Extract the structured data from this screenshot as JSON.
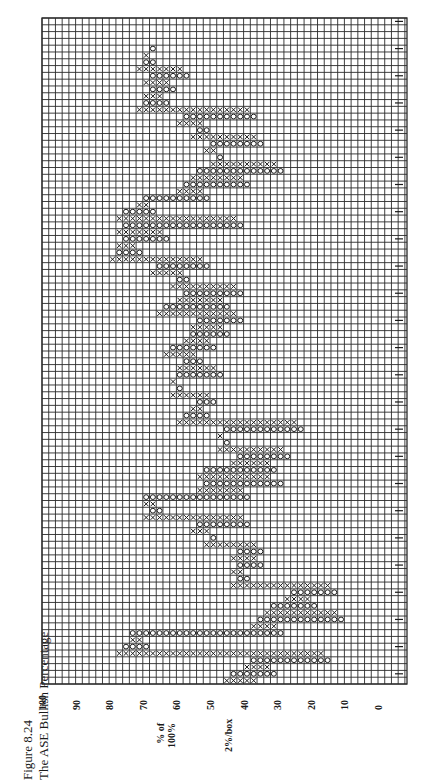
{
  "figure": {
    "number": "Figure 8.24",
    "title": "The ASE Bullish Percentage"
  },
  "chart_data": {
    "type": "point-and-figure",
    "title": "The ASE Bullish Percentage",
    "orientation": "rotated 90° counter-clockwise (time runs bottom→top, value axis runs left=100 → right=0)",
    "ylabel": "% of 100%",
    "box_size_label": "2%/box",
    "box_size": 2,
    "ylim": [
      0,
      100
    ],
    "y_ticks": [
      100,
      90,
      80,
      70,
      60,
      50,
      40,
      30,
      20,
      10,
      0
    ],
    "grid": true,
    "legend": "X = rising column, O = falling column; digits/letters inside boxes mark months; handwritten date marks along the right margin (illegible)",
    "columns": [
      {
        "type": "X",
        "low": 36,
        "high": 46
      },
      {
        "type": "O",
        "low": 30,
        "high": 44
      },
      {
        "type": "X",
        "low": 32,
        "high": 40
      },
      {
        "type": "O",
        "low": 14,
        "high": 38
      },
      {
        "type": "X",
        "low": 16,
        "high": 78
      },
      {
        "type": "O",
        "low": 68,
        "high": 76
      },
      {
        "type": "X",
        "low": 70,
        "high": 74
      },
      {
        "type": "O",
        "low": 28,
        "high": 74
      },
      {
        "type": "X",
        "low": 30,
        "high": 38
      },
      {
        "type": "O",
        "low": 10,
        "high": 36
      },
      {
        "type": "X",
        "low": 12,
        "high": 34
      },
      {
        "type": "O",
        "low": 18,
        "high": 32
      },
      {
        "type": "X",
        "low": 20,
        "high": 28
      },
      {
        "type": "O",
        "low": 12,
        "high": 26
      },
      {
        "type": "X",
        "low": 14,
        "high": 44
      },
      {
        "type": "O",
        "low": 38,
        "high": 42
      },
      {
        "type": "X",
        "low": 40,
        "high": 44
      },
      {
        "type": "O",
        "low": 34,
        "high": 42
      },
      {
        "type": "X",
        "low": 36,
        "high": 44
      },
      {
        "type": "O",
        "low": 34,
        "high": 42
      },
      {
        "type": "X",
        "low": 36,
        "high": 52
      },
      {
        "type": "O",
        "low": 48,
        "high": 50
      },
      {
        "type": "X",
        "low": 50,
        "high": 56
      },
      {
        "type": "O",
        "low": 38,
        "high": 54
      },
      {
        "type": "X",
        "low": 40,
        "high": 70
      },
      {
        "type": "O",
        "low": 64,
        "high": 68
      },
      {
        "type": "X",
        "low": 66,
        "high": 70
      },
      {
        "type": "O",
        "low": 38,
        "high": 70
      },
      {
        "type": "X",
        "low": 40,
        "high": 54
      },
      {
        "type": "O",
        "low": 28,
        "high": 52
      },
      {
        "type": "X",
        "low": 32,
        "high": 54
      },
      {
        "type": "O",
        "low": 30,
        "high": 52
      },
      {
        "type": "X",
        "low": 32,
        "high": 44
      },
      {
        "type": "O",
        "low": 26,
        "high": 42
      },
      {
        "type": "X",
        "low": 28,
        "high": 48
      },
      {
        "type": "O",
        "low": 44,
        "high": 46
      },
      {
        "type": "X",
        "low": 46,
        "high": 48
      },
      {
        "type": "O",
        "low": 22,
        "high": 46
      },
      {
        "type": "X",
        "low": 24,
        "high": 60
      },
      {
        "type": "O",
        "low": 50,
        "high": 58
      },
      {
        "type": "X",
        "low": 52,
        "high": 56
      },
      {
        "type": "O",
        "low": 48,
        "high": 54
      },
      {
        "type": "X",
        "low": 50,
        "high": 62
      },
      {
        "type": "O",
        "low": 58,
        "high": 60
      },
      {
        "type": "X",
        "low": 60,
        "high": 62
      },
      {
        "type": "O",
        "low": 46,
        "high": 60
      },
      {
        "type": "X",
        "low": 48,
        "high": 60
      },
      {
        "type": "O",
        "low": 52,
        "high": 58
      },
      {
        "type": "X",
        "low": 54,
        "high": 64
      },
      {
        "type": "O",
        "low": 48,
        "high": 62
      },
      {
        "type": "X",
        "low": 50,
        "high": 58
      },
      {
        "type": "O",
        "low": 44,
        "high": 56
      },
      {
        "type": "X",
        "low": 46,
        "high": 56
      },
      {
        "type": "O",
        "low": 40,
        "high": 54
      },
      {
        "type": "X",
        "low": 42,
        "high": 66
      },
      {
        "type": "O",
        "low": 44,
        "high": 64
      },
      {
        "type": "X",
        "low": 46,
        "high": 60
      },
      {
        "type": "O",
        "low": 40,
        "high": 58
      },
      {
        "type": "X",
        "low": 42,
        "high": 62
      },
      {
        "type": "O",
        "low": 56,
        "high": 60
      },
      {
        "type": "X",
        "low": 58,
        "high": 68
      },
      {
        "type": "O",
        "low": 50,
        "high": 66
      },
      {
        "type": "X",
        "low": 52,
        "high": 80
      },
      {
        "type": "O",
        "low": 70,
        "high": 78
      },
      {
        "type": "X",
        "low": 72,
        "high": 78
      },
      {
        "type": "O",
        "low": 62,
        "high": 76
      },
      {
        "type": "X",
        "low": 64,
        "high": 78
      },
      {
        "type": "O",
        "low": 40,
        "high": 76
      },
      {
        "type": "X",
        "low": 42,
        "high": 78
      },
      {
        "type": "O",
        "low": 66,
        "high": 76
      },
      {
        "type": "X",
        "low": 68,
        "high": 72
      },
      {
        "type": "O",
        "low": 50,
        "high": 70
      },
      {
        "type": "X",
        "low": 52,
        "high": 60
      },
      {
        "type": "O",
        "low": 38,
        "high": 58
      },
      {
        "type": "X",
        "low": 40,
        "high": 56
      },
      {
        "type": "O",
        "low": 28,
        "high": 54
      },
      {
        "type": "X",
        "low": 30,
        "high": 50
      },
      {
        "type": "O",
        "low": 46,
        "high": 48
      },
      {
        "type": "X",
        "low": 48,
        "high": 52
      },
      {
        "type": "O",
        "low": 34,
        "high": 50
      },
      {
        "type": "X",
        "low": 36,
        "high": 56
      },
      {
        "type": "O",
        "low": 50,
        "high": 54
      },
      {
        "type": "X",
        "low": 52,
        "high": 60
      },
      {
        "type": "O",
        "low": 36,
        "high": 58
      },
      {
        "type": "X",
        "low": 38,
        "high": 72
      },
      {
        "type": "O",
        "low": 62,
        "high": 70
      },
      {
        "type": "X",
        "low": 64,
        "high": 70
      },
      {
        "type": "O",
        "low": 60,
        "high": 68
      },
      {
        "type": "X",
        "low": 62,
        "high": 70
      },
      {
        "type": "O",
        "low": 56,
        "high": 68
      },
      {
        "type": "X",
        "low": 58,
        "high": 72
      },
      {
        "type": "O",
        "low": 66,
        "high": 70
      },
      {
        "type": "X",
        "low": 68,
        "high": 70
      },
      {
        "type": "O",
        "low": 66,
        "high": 68
      }
    ]
  },
  "axis": {
    "ticks": [
      "100",
      "90",
      "80",
      "70",
      "60",
      "50",
      "40",
      "30",
      "20",
      "10",
      "0"
    ],
    "ylabel_line1": "% of",
    "ylabel_line2": "100%",
    "box_label": "2%/box"
  },
  "colors": {
    "grid": "#2a2a2a",
    "marks": "#1a1a1a",
    "background": "#ffffff"
  }
}
